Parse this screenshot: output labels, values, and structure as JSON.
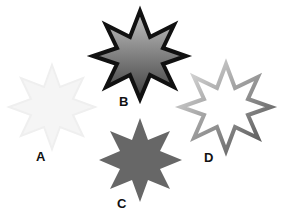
{
  "stars": [
    {
      "id": "A",
      "label": "A",
      "description": "very faint light-gray fill, no visible outline",
      "fill": "#f4f4f4",
      "stroke": "#f0f0f0"
    },
    {
      "id": "B",
      "label": "B",
      "description": "gray gradient fill with thick black outline",
      "fill_top": "#b8b8b8",
      "fill_bottom": "#4a4a4a",
      "stroke": "#111111"
    },
    {
      "id": "C",
      "label": "C",
      "description": "solid dark-gray fill, no outline",
      "fill": "#666666"
    },
    {
      "id": "D",
      "label": "D",
      "description": "white fill with gradient gray outline (light to dark)",
      "fill": "#ffffff",
      "stroke_light": "#dcdcdc",
      "stroke_dark": "#555555"
    }
  ]
}
